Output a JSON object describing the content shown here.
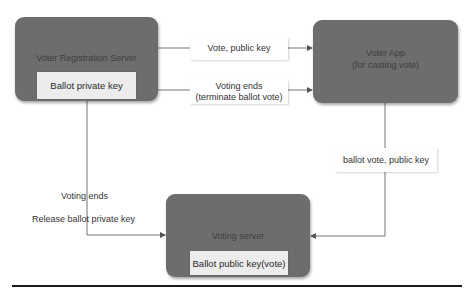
{
  "nodes": {
    "registration_server": {
      "title": "Voter Registration Server",
      "inner": "Ballot private key"
    },
    "voter_app": {
      "title_line1": "Voter App",
      "title_line2": "(for casting vote)"
    },
    "voting_server": {
      "title": "Voting server",
      "inner": "Ballot public key(vote)"
    }
  },
  "edges": {
    "reg_to_app_1": {
      "label": "Vote, public key"
    },
    "reg_to_app_2": {
      "label_line1": "Voting ends",
      "label_line2": "(terminate ballot vote)"
    },
    "app_to_voting": {
      "label": "ballot vote, public key"
    },
    "reg_to_voting": {
      "label_line1": "Voting ends",
      "label_line2": "Release ballot private key"
    }
  },
  "colors": {
    "node_fill": "#6d6d6d",
    "inner_fill": "#ececec",
    "line": "#777777"
  }
}
